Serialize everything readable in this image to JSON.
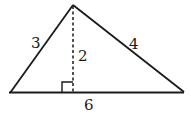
{
  "diagram": {
    "type": "triangle",
    "stroke_color": "#1a1a1a",
    "vertices": {
      "apex": [
        73,
        5
      ],
      "left": [
        10,
        93
      ],
      "right": [
        184,
        92
      ]
    },
    "altitude": {
      "from": [
        73,
        5
      ],
      "to": [
        73,
        93
      ],
      "style": "dashed",
      "label": "2"
    },
    "right_angle_marker": {
      "x": 62,
      "y": 82,
      "size": 11
    },
    "labels": {
      "left_side": "3",
      "right_side": "4",
      "altitude": "2",
      "base": "6"
    }
  }
}
